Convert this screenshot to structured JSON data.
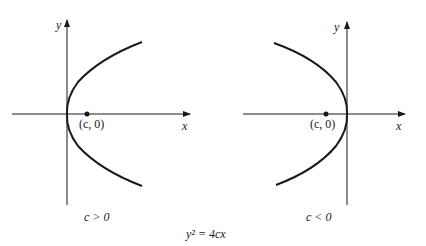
{
  "figure": {
    "caption": "y² = 4cx",
    "panels": [
      {
        "id": "left",
        "condition": "c > 0",
        "x_axis_label": "x",
        "y_axis_label": "y",
        "focus_label": "(c, 0)",
        "opens": "right"
      },
      {
        "id": "right",
        "condition": "c < 0",
        "x_axis_label": "x",
        "y_axis_label": "y",
        "focus_label": "(c, 0)",
        "opens": "left"
      }
    ],
    "colors": {
      "stroke": "#1a1a1a",
      "background": "#ffffff"
    }
  }
}
